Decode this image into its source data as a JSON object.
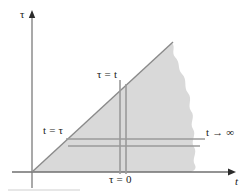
{
  "figure": {
    "type": "diagram",
    "background_color": "#ffffff",
    "shaded_region_color": "#d9d9d9",
    "line_color": "#7a7a7a",
    "text_color": "#1a1a1a",
    "axes": {
      "vertical": {
        "name": "tau-axis",
        "label": "τ",
        "arrow": "up",
        "x": 32,
        "y_top": 16,
        "y_bottom": 188
      },
      "horizontal": {
        "name": "t-axis",
        "label": "t",
        "arrow": "right",
        "y": 172,
        "x_left": 12,
        "x_right": 232
      }
    },
    "diagonal": {
      "name": "tau-equals-t-line",
      "label": "τ = t",
      "from": [
        32,
        172
      ],
      "to": [
        172,
        43
      ]
    },
    "markers": {
      "vertical_pair": {
        "label": "τ = 0",
        "x_positions": [
          120,
          126
        ],
        "y_top": 80,
        "y_bottom": 172
      },
      "horizontal_pair": {
        "label": "t → ∞",
        "y_positions": [
          139,
          146
        ],
        "x_left": 66,
        "x_right": 205
      }
    },
    "labels": [
      {
        "id": "tau-axis-label",
        "text": "τ",
        "x": 22,
        "y": 10,
        "italic": false
      },
      {
        "id": "t-axis-label",
        "text": "t",
        "x": 234,
        "y": 178,
        "italic": true
      },
      {
        "id": "tau-equals-t",
        "text": "τ = t",
        "x": 98,
        "y": 70,
        "italic": false
      },
      {
        "id": "t-equals-tau",
        "text": "t = τ",
        "x": 43,
        "y": 126,
        "italic": false
      },
      {
        "id": "t-to-infinity",
        "text": "t → ∞",
        "x": 207,
        "y": 128,
        "italic": false
      },
      {
        "id": "tau-equals-zero",
        "text": "τ = 0",
        "x": 110,
        "y": 174,
        "italic": false
      }
    ],
    "caption_rule": {
      "name": "caption-rule",
      "x": 8,
      "y": 190,
      "width": 72
    }
  }
}
